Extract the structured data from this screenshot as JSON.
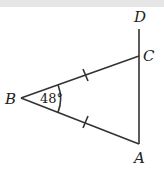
{
  "diagram": {
    "points": {
      "A": "A",
      "B": "B",
      "C": "C",
      "D": "D"
    },
    "angle_B_label": "48°",
    "equal_sides": [
      "BC",
      "BA"
    ],
    "segments": [
      "BC",
      "BA",
      "AC",
      "CD"
    ]
  }
}
